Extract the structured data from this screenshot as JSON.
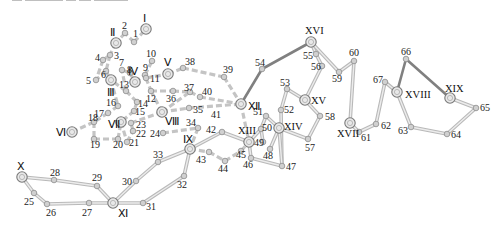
{
  "figure": {
    "caption_fragment_clipped": true,
    "colors": {
      "solid_dark": "#808080",
      "solid_light_outer": "#b9b9b9",
      "solid_light_inner": "#ececec",
      "dashed": "#c4c4c4",
      "node_fill": "#d0d0d0",
      "node_stroke": "#8d8d8d",
      "hub_fill": "#e8e8e8",
      "hub_stroke": "#7a7a7a",
      "text": "#222222"
    }
  },
  "hubs": [
    {
      "id": "I",
      "label": "Ⅰ",
      "x": 146,
      "y": 29,
      "lx": 143,
      "ly": 22
    },
    {
      "id": "II",
      "label": "Ⅱ",
      "x": 116,
      "y": 43,
      "lx": 110,
      "ly": 36
    },
    {
      "id": "III",
      "label": "Ⅲ",
      "x": 111,
      "y": 80,
      "lx": 107,
      "ly": 96
    },
    {
      "id": "IV",
      "label": "Ⅳ",
      "x": 135,
      "y": 82,
      "lx": 128,
      "ly": 75
    },
    {
      "id": "V",
      "label": "Ⅴ",
      "x": 168,
      "y": 74,
      "lx": 164,
      "ly": 66
    },
    {
      "id": "VI",
      "label": "Ⅵ",
      "x": 72,
      "y": 132,
      "lx": 56,
      "ly": 136
    },
    {
      "id": "VII",
      "label": "Ⅶ",
      "x": 121,
      "y": 122,
      "lx": 108,
      "ly": 128
    },
    {
      "id": "VIII",
      "label": "Ⅷ",
      "x": 162,
      "y": 112,
      "lx": 165,
      "ly": 125
    },
    {
      "id": "IX",
      "label": "Ⅸ",
      "x": 190,
      "y": 149,
      "lx": 183,
      "ly": 143
    },
    {
      "id": "X",
      "label": "Ⅹ",
      "x": 22,
      "y": 177,
      "lx": 17,
      "ly": 170
    },
    {
      "id": "XI",
      "label": "Ⅺ",
      "x": 113,
      "y": 203,
      "lx": 118,
      "ly": 217
    },
    {
      "id": "XII",
      "label": "Ⅻ",
      "x": 241,
      "y": 104,
      "lx": 248,
      "ly": 110
    },
    {
      "id": "XIII",
      "label": "XIII",
      "x": 249,
      "y": 142,
      "lx": 238,
      "ly": 134
    },
    {
      "id": "XIV",
      "label": "XIV",
      "x": 279,
      "y": 128,
      "lx": 284,
      "ly": 130
    },
    {
      "id": "XV",
      "label": "XV",
      "x": 305,
      "y": 100,
      "lx": 311,
      "ly": 104
    },
    {
      "id": "XVI",
      "label": "XVI",
      "x": 311,
      "y": 42,
      "lx": 305,
      "ly": 34
    },
    {
      "id": "XVII",
      "label": "XVII",
      "x": 350,
      "y": 123,
      "lx": 337,
      "ly": 137
    },
    {
      "id": "XVIII",
      "label": "XVIII",
      "x": 397,
      "y": 92,
      "lx": 405,
      "ly": 98
    },
    {
      "id": "XIX",
      "label": "XIX",
      "x": 450,
      "y": 98,
      "lx": 445,
      "ly": 92
    }
  ],
  "nodes": [
    {
      "id": "1",
      "x": 134,
      "y": 42,
      "lx": 133,
      "ly": 37
    },
    {
      "id": "2",
      "x": 125,
      "y": 33,
      "lx": 122,
      "ly": 29
    },
    {
      "id": "3",
      "x": 110,
      "y": 55,
      "lx": 114,
      "ly": 59
    },
    {
      "id": "4",
      "x": 103,
      "y": 60,
      "lx": 95,
      "ly": 61
    },
    {
      "id": "5",
      "x": 96,
      "y": 80,
      "lx": 86,
      "ly": 84
    },
    {
      "id": "6",
      "x": 106,
      "y": 71,
      "lx": 101,
      "ly": 78
    },
    {
      "id": "7",
      "x": 122,
      "y": 70,
      "lx": 119,
      "ly": 66
    },
    {
      "id": "8",
      "x": 130,
      "y": 73,
      "lx": 127,
      "ly": 73
    },
    {
      "id": "9",
      "x": 145,
      "y": 75,
      "lx": 143,
      "ly": 71
    },
    {
      "id": "10",
      "x": 152,
      "y": 61,
      "lx": 146,
      "ly": 57
    },
    {
      "id": "11",
      "x": 146,
      "y": 78,
      "lx": 150,
      "ly": 82
    },
    {
      "id": "12",
      "x": 151,
      "y": 91,
      "lx": 146,
      "ly": 102
    },
    {
      "id": "13",
      "x": 126,
      "y": 91,
      "lx": 119,
      "ly": 88
    },
    {
      "id": "14",
      "x": 137,
      "y": 102,
      "lx": 138,
      "ly": 107
    },
    {
      "id": "15",
      "x": 134,
      "y": 111,
      "lx": 135,
      "ly": 115
    },
    {
      "id": "16",
      "x": 118,
      "y": 106,
      "lx": 106,
      "ly": 106
    },
    {
      "id": "17",
      "x": 108,
      "y": 113,
      "lx": 94,
      "ly": 117
    },
    {
      "id": "18",
      "x": 94,
      "y": 122,
      "lx": 88,
      "ly": 121
    },
    {
      "id": "19",
      "x": 94,
      "y": 139,
      "lx": 90,
      "ly": 148
    },
    {
      "id": "20",
      "x": 118,
      "y": 139,
      "lx": 113,
      "ly": 148
    },
    {
      "id": "21",
      "x": 127,
      "y": 142,
      "lx": 129,
      "ly": 146
    },
    {
      "id": "22",
      "x": 133,
      "y": 131,
      "lx": 136,
      "ly": 137
    },
    {
      "id": "23",
      "x": 131,
      "y": 123,
      "lx": 136,
      "ly": 128
    },
    {
      "id": "24",
      "x": 163,
      "y": 133,
      "lx": 150,
      "ly": 137
    },
    {
      "id": "25",
      "x": 34,
      "y": 193,
      "lx": 24,
      "ly": 205
    },
    {
      "id": "26",
      "x": 47,
      "y": 204,
      "lx": 46,
      "ly": 216
    },
    {
      "id": "27",
      "x": 89,
      "y": 203,
      "lx": 82,
      "ly": 216
    },
    {
      "id": "28",
      "x": 54,
      "y": 180,
      "lx": 50,
      "ly": 176
    },
    {
      "id": "29",
      "x": 97,
      "y": 186,
      "lx": 92,
      "ly": 181
    },
    {
      "id": "30",
      "x": 136,
      "y": 181,
      "lx": 122,
      "ly": 185
    },
    {
      "id": "31",
      "x": 143,
      "y": 203,
      "lx": 146,
      "ly": 210
    },
    {
      "id": "32",
      "x": 184,
      "y": 176,
      "lx": 177,
      "ly": 188
    },
    {
      "id": "33",
      "x": 158,
      "y": 162,
      "lx": 153,
      "ly": 158
    },
    {
      "id": "34",
      "x": 198,
      "y": 128,
      "lx": 186,
      "ly": 126
    },
    {
      "id": "35",
      "x": 189,
      "y": 108,
      "lx": 193,
      "ly": 113
    },
    {
      "id": "36",
      "x": 173,
      "y": 91,
      "lx": 166,
      "ly": 102
    },
    {
      "id": "37",
      "x": 190,
      "y": 92,
      "lx": 184,
      "ly": 91
    },
    {
      "id": "38",
      "x": 183,
      "y": 68,
      "lx": 185,
      "ly": 65
    },
    {
      "id": "39",
      "x": 224,
      "y": 77,
      "lx": 223,
      "ly": 73
    },
    {
      "id": "40",
      "x": 200,
      "y": 97,
      "lx": 202,
      "ly": 95
    },
    {
      "id": "41",
      "x": 0,
      "y": 0,
      "lx": 211,
      "ly": 118,
      "label_only": true
    },
    {
      "id": "42",
      "x": 222,
      "y": 132,
      "lx": 206,
      "ly": 133
    },
    {
      "id": "43",
      "x": 209,
      "y": 152,
      "lx": 196,
      "ly": 163
    },
    {
      "id": "44",
      "x": 225,
      "y": 161,
      "lx": 218,
      "ly": 172
    },
    {
      "id": "45",
      "x": 241,
      "y": 151,
      "lx": 236,
      "ly": 158
    },
    {
      "id": "46",
      "x": 251,
      "y": 158,
      "lx": 243,
      "ly": 168
    },
    {
      "id": "47",
      "x": 282,
      "y": 166,
      "lx": 286,
      "ly": 170
    },
    {
      "id": "48",
      "x": 270,
      "y": 149,
      "lx": 263,
      "ly": 159
    },
    {
      "id": "49",
      "x": 263,
      "y": 142,
      "lx": 254,
      "ly": 146
    },
    {
      "id": "50",
      "x": 261,
      "y": 129,
      "lx": 262,
      "ly": 131
    },
    {
      "id": "51",
      "x": 266,
      "y": 116,
      "lx": 253,
      "ly": 115
    },
    {
      "id": "52",
      "x": 281,
      "y": 110,
      "lx": 284,
      "ly": 113
    },
    {
      "id": "53",
      "x": 287,
      "y": 89,
      "lx": 280,
      "ly": 86
    },
    {
      "id": "54",
      "x": 262,
      "y": 69,
      "lx": 255,
      "ly": 66
    },
    {
      "id": "55",
      "x": 316,
      "y": 54,
      "lx": 303,
      "ly": 59
    },
    {
      "id": "56",
      "x": 322,
      "y": 66,
      "lx": 311,
      "ly": 70
    },
    {
      "id": "57",
      "x": 308,
      "y": 139,
      "lx": 305,
      "ly": 151
    },
    {
      "id": "58",
      "x": 320,
      "y": 116,
      "lx": 325,
      "ly": 120
    },
    {
      "id": "59",
      "x": 339,
      "y": 72,
      "lx": 332,
      "ly": 82
    },
    {
      "id": "60",
      "x": 354,
      "y": 61,
      "lx": 349,
      "ly": 56
    },
    {
      "id": "61",
      "x": 359,
      "y": 132,
      "lx": 361,
      "ly": 141
    },
    {
      "id": "62",
      "x": 376,
      "y": 124,
      "lx": 381,
      "ly": 129
    },
    {
      "id": "63",
      "x": 411,
      "y": 127,
      "lx": 398,
      "ly": 134
    },
    {
      "id": "64",
      "x": 447,
      "y": 134,
      "lx": 451,
      "ly": 138
    },
    {
      "id": "65",
      "x": 476,
      "y": 108,
      "lx": 480,
      "ly": 111
    },
    {
      "id": "66",
      "x": 406,
      "y": 59,
      "lx": 401,
      "ly": 55
    },
    {
      "id": "67",
      "x": 385,
      "y": 82,
      "lx": 373,
      "ly": 83
    }
  ],
  "edges_dark": [
    [
      "XII",
      "54"
    ],
    [
      "54",
      "XVI"
    ],
    [
      "XVIII",
      "66"
    ],
    [
      "66",
      "XIX"
    ]
  ],
  "edges_light": [
    [
      "XVI",
      "55"
    ],
    [
      "55",
      "56"
    ],
    [
      "56",
      "XV"
    ],
    [
      "XVI",
      "59"
    ],
    [
      "59",
      "60"
    ],
    [
      "60",
      "XVII"
    ],
    [
      "XVII",
      "61"
    ],
    [
      "61",
      "62"
    ],
    [
      "62",
      "67"
    ],
    [
      "67",
      "XVIII"
    ],
    [
      "XVIII",
      "63"
    ],
    [
      "63",
      "64"
    ],
    [
      "64",
      "65"
    ],
    [
      "65",
      "XIX"
    ],
    [
      "XV",
      "53"
    ],
    [
      "53",
      "52"
    ],
    [
      "52",
      "47"
    ],
    [
      "XV",
      "58"
    ],
    [
      "58",
      "57"
    ],
    [
      "57",
      "XIV"
    ],
    [
      "XIV",
      "51"
    ],
    [
      "51",
      "50"
    ],
    [
      "50",
      "XIII"
    ],
    [
      "XIII",
      "46"
    ],
    [
      "46",
      "47"
    ],
    [
      "XIV",
      "48"
    ],
    [
      "XIV",
      "47"
    ],
    [
      "49",
      "50"
    ],
    [
      "IX",
      "42"
    ],
    [
      "42",
      "XIII"
    ],
    [
      "IX",
      "33"
    ],
    [
      "33",
      "30"
    ],
    [
      "30",
      "XI"
    ],
    [
      "IX",
      "32"
    ],
    [
      "32",
      "31"
    ],
    [
      "31",
      "XI"
    ],
    [
      "XI",
      "27"
    ],
    [
      "27",
      "26"
    ],
    [
      "26",
      "25"
    ],
    [
      "25",
      "X"
    ],
    [
      "X",
      "28"
    ],
    [
      "28",
      "29"
    ],
    [
      "29",
      "XI"
    ]
  ],
  "edges_dashed": [
    [
      "1",
      "2"
    ],
    [
      "1",
      "I"
    ],
    [
      "2",
      "II"
    ],
    [
      "II",
      "3"
    ],
    [
      "3",
      "4"
    ],
    [
      "3",
      "6"
    ],
    [
      "6",
      "5"
    ],
    [
      "4",
      "5"
    ],
    [
      "6",
      "III"
    ],
    [
      "7",
      "8"
    ],
    [
      "8",
      "IV"
    ],
    [
      "IV",
      "9"
    ],
    [
      "9",
      "10"
    ],
    [
      "9",
      "11"
    ],
    [
      "11",
      "12"
    ],
    [
      "11",
      "V"
    ],
    [
      "V",
      "38"
    ],
    [
      "38",
      "39"
    ],
    [
      "39",
      "XII"
    ],
    [
      "12",
      "36"
    ],
    [
      "36",
      "37"
    ],
    [
      "37",
      "40"
    ],
    [
      "40",
      "XII"
    ],
    [
      "13",
      "III"
    ],
    [
      "13",
      "14"
    ],
    [
      "14",
      "15"
    ],
    [
      "III",
      "16"
    ],
    [
      "16",
      "17"
    ],
    [
      "17",
      "18"
    ],
    [
      "18",
      "19"
    ],
    [
      "VI",
      "18"
    ],
    [
      "19",
      "20"
    ],
    [
      "20",
      "VII"
    ],
    [
      "VII",
      "21"
    ],
    [
      "21",
      "22"
    ],
    [
      "22",
      "23"
    ],
    [
      "23",
      "VIII"
    ],
    [
      "15",
      "VII"
    ],
    [
      "VIII",
      "37"
    ],
    [
      "VIII",
      "35"
    ],
    [
      "35",
      "XII"
    ],
    [
      "24",
      "34"
    ],
    [
      "34",
      "IX"
    ],
    [
      "IX",
      "43"
    ],
    [
      "43",
      "44"
    ],
    [
      "44",
      "45"
    ],
    [
      "45",
      "XIII"
    ],
    [
      "XII",
      "XIII"
    ],
    [
      "VIII",
      "12"
    ],
    [
      "13",
      "7"
    ]
  ]
}
